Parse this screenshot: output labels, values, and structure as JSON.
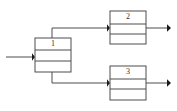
{
  "diagram": {
    "type": "block-flow-diagram",
    "background_color": "#ffffff",
    "line_color": "#4d4d4d",
    "arrow_color": "#1a1a1a",
    "label_color": "#333333",
    "blocks": [
      {
        "id": "block-1",
        "label": "1",
        "rows": 3,
        "x": 35,
        "y": 38,
        "width": 36,
        "height": 34
      },
      {
        "id": "block-2",
        "label": "2",
        "rows": 3,
        "x": 110,
        "y": 11,
        "width": 36,
        "height": 33
      },
      {
        "id": "block-3",
        "label": "3",
        "rows": 3,
        "x": 110,
        "y": 66,
        "width": 36,
        "height": 34
      }
    ],
    "connections": [
      {
        "id": "input-to-block-1",
        "from": "input",
        "to": "block-1",
        "has_arrowhead": true
      },
      {
        "id": "block-1-to-block-2",
        "from": "block-1",
        "to": "block-2",
        "has_arrowhead": true
      },
      {
        "id": "block-1-to-block-3",
        "from": "block-1",
        "to": "block-3",
        "has_arrowhead": true
      },
      {
        "id": "block-2-output",
        "from": "block-2",
        "to": "output",
        "has_arrowhead": true
      },
      {
        "id": "block-3-output",
        "from": "block-3",
        "to": "output",
        "has_arrowhead": true
      }
    ]
  }
}
